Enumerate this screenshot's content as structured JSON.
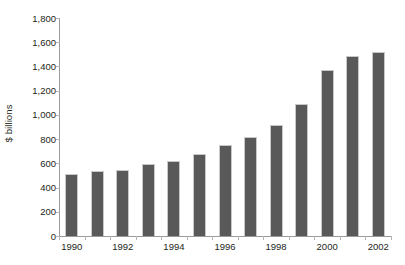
{
  "chart_data": {
    "type": "bar",
    "title": "",
    "subtitle": "",
    "xlabel": "",
    "ylabel": "$ billions",
    "ylim": [
      0,
      1800
    ],
    "ytick_step": 200,
    "yticks": [
      0,
      200,
      400,
      600,
      800,
      1000,
      1200,
      1400,
      1600,
      1800
    ],
    "ytick_labels": [
      "0",
      "200",
      "400",
      "600",
      "800",
      "1,000",
      "1,200",
      "1,400",
      "1,600",
      "1,800"
    ],
    "grid": false,
    "legend": false,
    "legend_position": "none",
    "categories": [
      "1990",
      "1991",
      "1992",
      "1993",
      "1994",
      "1995",
      "1996",
      "1997",
      "1998",
      "1999",
      "2000",
      "2001",
      "2002"
    ],
    "xtick_labels_shown": [
      "1990",
      "1992",
      "1994",
      "1996",
      "1998",
      "2000",
      "2002"
    ],
    "values": [
      510,
      535,
      545,
      595,
      620,
      680,
      750,
      820,
      915,
      1090,
      1370,
      1490,
      1520
    ],
    "series": [
      {
        "name": "$ billions",
        "values": [
          510,
          535,
          545,
          595,
          620,
          680,
          750,
          820,
          915,
          1090,
          1370,
          1490,
          1520
        ]
      }
    ],
    "colors": {
      "bar_fill": "#595959",
      "bar_edge": "#c9c9c9",
      "axis": "#9b9b9b",
      "tick": "#b5b5b5",
      "text": "#231f20",
      "background": "#ffffff"
    }
  }
}
